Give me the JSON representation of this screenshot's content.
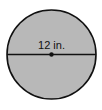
{
  "diagram": {
    "shape": "circle",
    "fill_color": "#b8b8b8",
    "stroke_color": "#111111",
    "diameter_label": "12 in.",
    "center_point": true
  }
}
